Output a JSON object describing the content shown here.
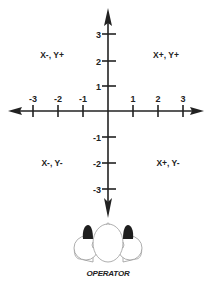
{
  "diagram": {
    "type": "coordinate-axes",
    "x_axis": {
      "ticks": [
        {
          "value": -3,
          "label": "-3",
          "x": 33
        },
        {
          "value": -2,
          "label": "-2",
          "x": 58
        },
        {
          "value": -1,
          "label": "-1",
          "x": 83
        },
        {
          "value": 1,
          "label": "1",
          "x": 133
        },
        {
          "value": 2,
          "label": "2",
          "x": 158
        },
        {
          "value": 3,
          "label": "3",
          "x": 183
        }
      ]
    },
    "y_axis": {
      "ticks": [
        {
          "value": 3,
          "label": "3",
          "y": 34
        },
        {
          "value": 2,
          "label": "2",
          "y": 61
        },
        {
          "value": 1,
          "label": "1",
          "y": 86
        },
        {
          "value": -1,
          "label": "-1",
          "y": 137
        },
        {
          "value": -2,
          "label": "-2",
          "y": 163
        },
        {
          "value": -3,
          "label": "-3",
          "y": 189
        }
      ]
    },
    "quadrants": {
      "top_left": "X-, Y+",
      "top_right": "X+, Y+",
      "bottom_left": "X-, Y-",
      "bottom_right": "X+, Y-"
    },
    "operator": {
      "label": "OPERATOR"
    },
    "colors": {
      "line": "#222222",
      "background": "#ffffff",
      "shoulder_fill": "#1e1e1e"
    }
  }
}
